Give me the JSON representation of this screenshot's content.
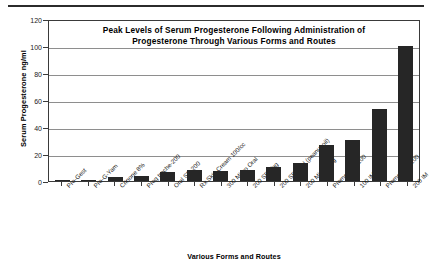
{
  "chart_data": {
    "type": "bar",
    "title": "Peak Levels of Serum Progesterone Following Administration of Progesterone Through Various Forms and Routes",
    "title_lines": [
      "Peak Levels of Serum Progesterone Following Administration of",
      "Progesterone Through Various Forms and Routes"
    ],
    "xlabel": "Various Forms and Routes",
    "ylabel": "Serum Progesterone ng/ml",
    "ylim": [
      0,
      120
    ],
    "ytick_labels": [
      "0",
      "20",
      "40",
      "60",
      "80",
      "100",
      "120"
    ],
    "ytick_values": [
      0,
      20,
      40,
      60,
      80,
      100,
      120
    ],
    "grid": true,
    "legend": "none",
    "bar_color": "#262626",
    "gridline_color": "#8e8e8e",
    "categories": [
      "Pro-Gest",
      "Pro-G-Yam",
      "Crinone 8%",
      "Prog troche-200",
      "Oral SR-200",
      "Rx Skin Cream 100/cc",
      "300 Micro Oral",
      "200 SR-Vag",
      "200 SR-Oral (peanut oil)",
      "200 Micro Vag",
      "Prometrium 100",
      "100 IM",
      "Prometrium 200",
      "200 IM"
    ],
    "values": [
      0.6,
      0.8,
      3.2,
      4.0,
      6.5,
      7.8,
      7.5,
      8.0,
      10.5,
      13.0,
      26.5,
      30.5,
      53.0,
      100.0
    ]
  }
}
